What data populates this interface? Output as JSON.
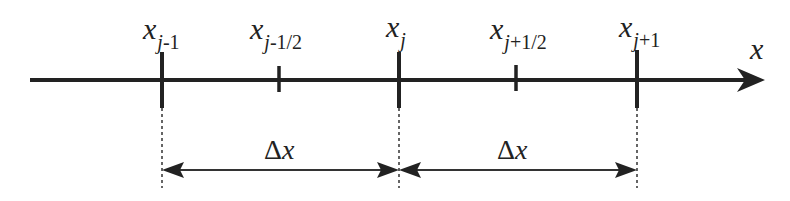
{
  "diagram": {
    "type": "finite-volume-grid",
    "colors": {
      "ink": "#222222",
      "background": "#ffffff"
    },
    "axis": {
      "label": "x",
      "y": 80,
      "start_x": 30,
      "end_x": 765
    },
    "nodes": [
      {
        "name": "x_j-1",
        "base": "x",
        "sub_var": "j",
        "sub_rest": "-1",
        "x": 162,
        "kind": "major"
      },
      {
        "name": "x_j-1/2",
        "base": "x",
        "sub_var": "j",
        "sub_rest": "-1/2",
        "x": 279,
        "kind": "minor"
      },
      {
        "name": "x_j",
        "base": "x",
        "sub_var": "j",
        "sub_rest": "",
        "x": 399,
        "kind": "major"
      },
      {
        "name": "x_j+1/2",
        "base": "x",
        "sub_var": "j",
        "sub_rest": "+1/2",
        "x": 516,
        "kind": "minor"
      },
      {
        "name": "x_j+1",
        "base": "x",
        "sub_var": "j",
        "sub_rest": "+1",
        "x": 637,
        "kind": "major"
      }
    ],
    "spacings": [
      {
        "label_delta": "Δ",
        "label_var": "x",
        "from": 162,
        "to": 399
      },
      {
        "label_delta": "Δ",
        "label_var": "x",
        "from": 399,
        "to": 637
      }
    ]
  }
}
